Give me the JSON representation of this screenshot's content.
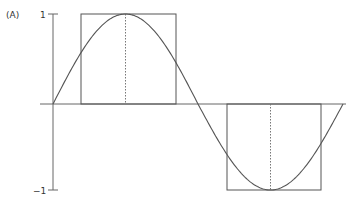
{
  "chart_data": {
    "type": "line",
    "title": "",
    "panel_label": "(A)",
    "xlabel": "",
    "ylabel": "",
    "ylim": [
      -1,
      1
    ],
    "yticks": [
      1,
      -1
    ],
    "ytick_labels": [
      "1",
      "−1"
    ],
    "grid": false,
    "legend": null,
    "series": [
      {
        "name": "sine wave",
        "kind": "curve",
        "x_phase": [
          0,
          0.25,
          0.5,
          0.75,
          1.0
        ],
        "values": [
          0,
          1,
          0,
          -1,
          0
        ]
      },
      {
        "name": "square pulse",
        "kind": "rectangles",
        "pulses": [
          {
            "x_phase_start": 0.1,
            "x_phase_end": 0.43,
            "value": 1
          },
          {
            "x_phase_start": 0.6,
            "x_phase_end": 0.93,
            "value": -1
          }
        ]
      }
    ],
    "annotations": [
      {
        "type": "dotted-vertical",
        "x_phase": 0.25,
        "from": 0,
        "to": 1
      },
      {
        "type": "dotted-vertical",
        "x_phase": 0.75,
        "from": 0,
        "to": -1
      }
    ]
  },
  "colors": {
    "curve": "#555555",
    "axis": "#666666",
    "text": "#333333"
  }
}
